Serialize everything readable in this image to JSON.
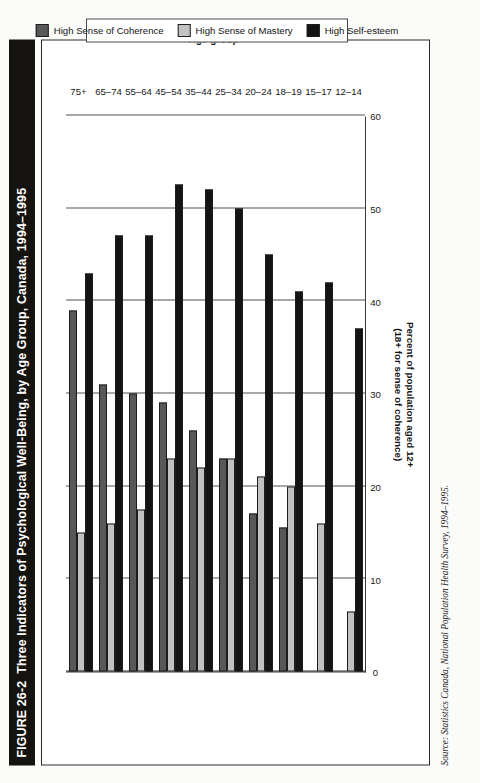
{
  "figure": {
    "number": "FIGURE 26-2",
    "title": "Three Indicators of Psychological Well-Being, by Age Group, Canada, 1994–1995",
    "source": "Source: Statistics Canada, National Population Health Survey, 1994–1995."
  },
  "colors": {
    "coherence": "#58585a",
    "mastery": "#c2c2c2",
    "esteem": "#141414",
    "title_bar_bg": "#15130f",
    "title_bar_fg": "#ffffff",
    "frame": "#2a2a28",
    "grid": "#55534f"
  },
  "chart_data": {
    "type": "bar",
    "orientation": "vertical-printed-sideways",
    "title": "Three Indicators of Psychological Well-Being, by Age Group, Canada, 1994–1995",
    "xlabel": "Age group",
    "ylabel": "Percent of population aged 12+ (18+ for sense of coherence)",
    "ylabel_line1": "Percent of population aged 12+",
    "ylabel_line2": "(18+ for sense of coherence)",
    "ylim": [
      0,
      60
    ],
    "yticks": [
      0,
      10,
      20,
      30,
      40,
      50,
      60
    ],
    "grid": true,
    "legend_position": "bottom",
    "categories": [
      "12–14",
      "15–17",
      "18–19",
      "20–24",
      "25–34",
      "35–44",
      "45–54",
      "55–64",
      "65–74",
      "75+"
    ],
    "series": [
      {
        "name": "High Sense of Coherence",
        "color": "#58585a",
        "values": [
          null,
          null,
          15.5,
          17.0,
          23.0,
          26.0,
          29.0,
          30.0,
          31.0,
          39.0
        ]
      },
      {
        "name": "High Sense of Mastery",
        "color": "#c2c2c2",
        "values": [
          6.5,
          16.0,
          20.0,
          21.0,
          23.0,
          22.0,
          23.0,
          17.5,
          16.0,
          15.0
        ]
      },
      {
        "name": "High Self-esteem",
        "color": "#141414",
        "values": [
          37.0,
          42.0,
          41.0,
          45.0,
          50.0,
          52.0,
          52.5,
          47.0,
          47.0,
          43.0
        ]
      }
    ]
  }
}
